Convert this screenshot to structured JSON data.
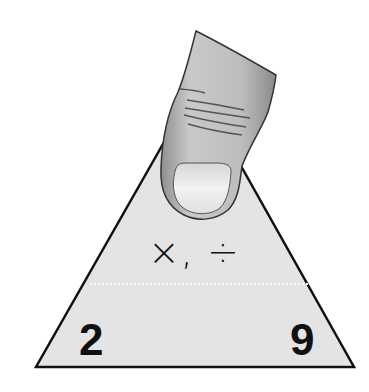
{
  "figure": {
    "type": "fact-family-triangle",
    "operations_label": "×, ÷",
    "top_number": "",
    "bottom_left_number": "2",
    "bottom_right_number": "9",
    "top_covered_by": "finger",
    "colors": {
      "triangle_fill": "#e4e4e4",
      "triangle_stroke": "#111111",
      "text": "#111111",
      "finger_fill": "#bdbdbd",
      "nail_fill": "#e6e6e6"
    }
  }
}
